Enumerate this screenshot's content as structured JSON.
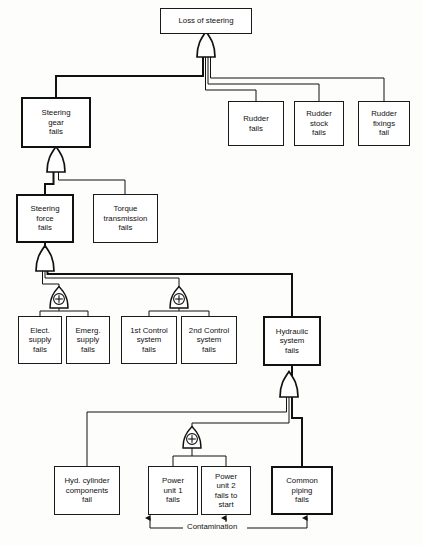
{
  "diagram": {
    "colors": {
      "line": "#111111",
      "box_border": "#1a1a1a",
      "box_border_bold": "#111111",
      "box_fill": "#ffffff",
      "background": "#fdfdfb",
      "text": "#111111"
    },
    "nodes": [
      {
        "id": "loss-of-steering",
        "label": "Loss of steering",
        "emphasis": "normal",
        "x": 160,
        "y": 8,
        "w": 92,
        "h": 26,
        "font_size": 7.8
      },
      {
        "id": "steering-gear-fails",
        "label": "Steering\ngear\nfails",
        "emphasis": "bold",
        "x": 21,
        "y": 97,
        "w": 70,
        "h": 51,
        "font_size": 7.8
      },
      {
        "id": "rudder-fails",
        "label": "Rudder\nfails",
        "emphasis": "normal",
        "x": 228,
        "y": 101,
        "w": 56,
        "h": 45,
        "font_size": 7.8
      },
      {
        "id": "rudder-stock-fails",
        "label": "Rudder\nstock\nfails",
        "emphasis": "normal",
        "x": 294,
        "y": 101,
        "w": 50,
        "h": 45,
        "font_size": 7.8
      },
      {
        "id": "rudder-fixings-fail",
        "label": "Rudder\nfixings\nfail",
        "emphasis": "normal",
        "x": 358,
        "y": 101,
        "w": 52,
        "h": 45,
        "font_size": 7.8
      },
      {
        "id": "steering-force-fails",
        "label": "Steering\nforce\nfails",
        "emphasis": "bold",
        "x": 16,
        "y": 194,
        "w": 58,
        "h": 49,
        "font_size": 7.8
      },
      {
        "id": "torque-transmission-fails",
        "label": "Torque\ntransmission\nfails",
        "emphasis": "normal",
        "x": 93,
        "y": 194,
        "w": 65,
        "h": 49,
        "font_size": 7.8
      },
      {
        "id": "elect-supply-fails",
        "label": "Elect.\nsupply\nfails",
        "emphasis": "normal",
        "x": 18,
        "y": 316,
        "w": 44,
        "h": 48,
        "font_size": 7.8
      },
      {
        "id": "emerg-supply-fails",
        "label": "Emerg.\nsupply\nfails",
        "emphasis": "normal",
        "x": 66,
        "y": 316,
        "w": 44,
        "h": 48,
        "font_size": 7.8
      },
      {
        "id": "first-control-system-fails",
        "label": "1st Control\nsystem\nfails",
        "emphasis": "normal",
        "x": 121,
        "y": 316,
        "w": 56,
        "h": 48,
        "font_size": 7.8
      },
      {
        "id": "second-control-system-fails",
        "label": "2nd Control\nsystem\nfails",
        "emphasis": "normal",
        "x": 181,
        "y": 316,
        "w": 56,
        "h": 48,
        "font_size": 7.8
      },
      {
        "id": "hydraulic-system-fails",
        "label": "Hydraulic\nsystem\nfails",
        "emphasis": "bold",
        "x": 263,
        "y": 316,
        "w": 58,
        "h": 50,
        "font_size": 7.8
      },
      {
        "id": "hyd-cylinder-components-fail",
        "label": "Hyd. cylinder\ncomponents\nfail",
        "emphasis": "normal",
        "x": 54,
        "y": 466,
        "w": 66,
        "h": 49,
        "font_size": 7.8
      },
      {
        "id": "power-unit-1-fails",
        "label": "Power\nunit 1\nfails",
        "emphasis": "normal",
        "x": 148,
        "y": 466,
        "w": 50,
        "h": 49,
        "font_size": 7.8
      },
      {
        "id": "power-unit-2-fails-to-start",
        "label": "Power\nunit 2\nfails to\nstart",
        "emphasis": "normal",
        "x": 201,
        "y": 466,
        "w": 50,
        "h": 49,
        "font_size": 7.8
      },
      {
        "id": "common-piping-fails",
        "label": "Common\npiping\nfails",
        "emphasis": "bold",
        "x": 271,
        "y": 466,
        "w": 62,
        "h": 49,
        "font_size": 7.8
      }
    ],
    "gates": [
      {
        "id": "gate-top-or",
        "type": "or",
        "symbol": "",
        "cx": 206,
        "cy": 48
      },
      {
        "id": "gate-steering-gear-or",
        "type": "or",
        "symbol": "",
        "cx": 56,
        "cy": 163
      },
      {
        "id": "gate-steering-force-or",
        "type": "or",
        "symbol": "",
        "cx": 45,
        "cy": 262
      },
      {
        "id": "gate-supply-or",
        "type": "or-plus",
        "symbol": "+",
        "cx": 59,
        "cy": 299
      },
      {
        "id": "gate-control-or",
        "type": "or-plus",
        "symbol": "+",
        "cx": 179,
        "cy": 299
      },
      {
        "id": "gate-hydraulic-or",
        "type": "or",
        "symbol": "",
        "cx": 289,
        "cy": 388
      },
      {
        "id": "gate-power-or",
        "type": "or-plus",
        "symbol": "+",
        "cx": 192,
        "cy": 439
      }
    ],
    "annotations": [
      {
        "id": "contamination-label",
        "text": "Contamination",
        "x": 190,
        "y": 524,
        "font_size": 7.8
      }
    ]
  }
}
